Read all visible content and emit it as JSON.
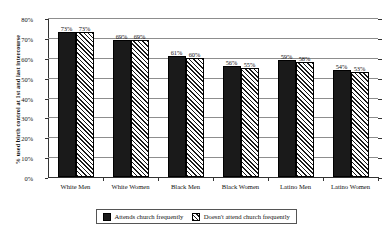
{
  "chart_data": {
    "type": "bar",
    "title": "",
    "xlabel": "",
    "ylabel": "% used birth control at 1st and last intercourse",
    "ylim": [
      0,
      80
    ],
    "ytick_labels": [
      "80%",
      "70%",
      "60%",
      "50%",
      "40%",
      "30%",
      "20%",
      "10%",
      "0%"
    ],
    "ytick_values": [
      80,
      70,
      60,
      50,
      40,
      30,
      20,
      10,
      0
    ],
    "grid": true,
    "legend_position": "bottom",
    "categories": [
      "White Men",
      "White Women",
      "Black Men",
      "Black Women",
      "Latino Men",
      "Latino Women"
    ],
    "series": [
      {
        "name": "Attends church frequently",
        "pattern": "solid",
        "color": "#1a1a1a",
        "values": [
          73,
          69,
          61,
          56,
          59,
          54
        ],
        "labels": [
          "73%",
          "69%",
          "61%",
          "56%",
          "59%",
          "54%"
        ]
      },
      {
        "name": "Doesn't attend church frequently",
        "pattern": "hatch",
        "color": "#ffffff",
        "values": [
          73,
          69,
          60,
          55,
          58,
          53
        ],
        "labels": [
          "73%",
          "69%",
          "60%",
          "55%",
          "58%",
          "53%"
        ]
      }
    ]
  },
  "legend": {
    "entries": [
      {
        "label": "Attends church frequently"
      },
      {
        "label": "Doesn't attend church frequently"
      }
    ]
  }
}
